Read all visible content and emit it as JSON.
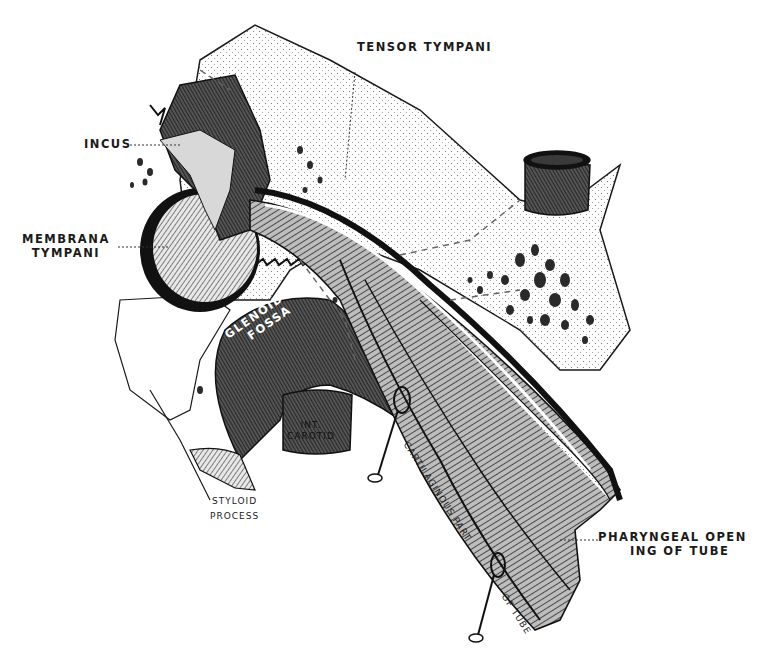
{
  "figure": {
    "style": "monochrome engraving",
    "colors": {
      "ink": "#1a1a1a",
      "paper": "#ffffff",
      "shade": "#3a3a3a",
      "mid": "#8a8a8a",
      "light": "#d8d8d8"
    }
  },
  "labels": {
    "tensor_tympani": "TENSOR TYMPANI",
    "incus": "INCUS",
    "membrana_tympani": [
      "MEMBRANA",
      "TYMPANI"
    ],
    "glenoid_fossa": [
      "GLENOID",
      "FOSSA"
    ],
    "int_carotid": [
      "INT.",
      "CAROTID"
    ],
    "styloid_process": [
      "STYLOID",
      "PROCESS"
    ],
    "cartilaginous_part": "CARTILAGINOUS PART",
    "of_tube": "OF TUBE",
    "pharyngeal_opening": [
      "PHARYNGEAL OPEN",
      "ING OF TUBE"
    ]
  }
}
